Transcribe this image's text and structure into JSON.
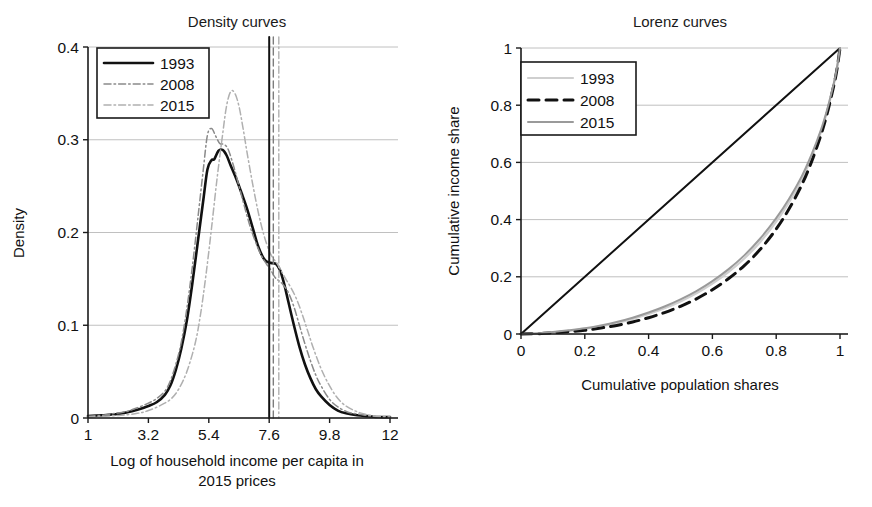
{
  "figure": {
    "background": "#ffffff",
    "panels": [
      "density",
      "lorenz"
    ]
  },
  "chart_data": [
    {
      "type": "line",
      "id": "density",
      "title": "Density curves",
      "xlabel": "Log of household income per capita in 2015 prices",
      "xlabel_line1": "Log of household income per capita in",
      "xlabel_line2": "2015 prices",
      "ylabel": "Density",
      "xlim": [
        1,
        12
      ],
      "ylim": [
        0,
        0.4
      ],
      "xticks": [
        1,
        3.2,
        5.4,
        7.6,
        9.8,
        12
      ],
      "xticklabels": [
        "1",
        "3.2",
        "5.4",
        "7.6",
        "9.8",
        "12"
      ],
      "yticks": [
        0,
        0.1,
        0.2,
        0.3,
        0.4
      ],
      "yticklabels": [
        "0",
        "0.1",
        "0.2",
        "0.3",
        "0.4"
      ],
      "grid": "horizontal",
      "legend_position": "upper-left",
      "legend": [
        "1993",
        "2008",
        "2015"
      ],
      "series": [
        {
          "name": "1993",
          "style": "solid",
          "color": "#111111",
          "width": 2.6,
          "x": [
            1.0,
            1.5,
            2.0,
            2.4,
            2.8,
            3.2,
            3.5,
            3.8,
            4.0,
            4.2,
            4.4,
            4.6,
            4.8,
            5.0,
            5.2,
            5.35,
            5.5,
            5.6,
            5.75,
            5.9,
            6.05,
            6.2,
            6.4,
            6.6,
            6.8,
            7.0,
            7.2,
            7.4,
            7.55,
            7.7,
            7.85,
            8.0,
            8.15,
            8.3,
            8.5,
            8.7,
            8.9,
            9.1,
            9.3,
            9.5,
            9.8,
            10.1,
            10.4,
            10.8,
            11.2,
            11.6,
            12.0
          ],
          "y": [
            0.002,
            0.003,
            0.004,
            0.006,
            0.009,
            0.013,
            0.017,
            0.025,
            0.035,
            0.052,
            0.075,
            0.105,
            0.145,
            0.19,
            0.235,
            0.268,
            0.278,
            0.279,
            0.288,
            0.289,
            0.283,
            0.272,
            0.258,
            0.242,
            0.225,
            0.205,
            0.185,
            0.172,
            0.168,
            0.167,
            0.166,
            0.159,
            0.144,
            0.125,
            0.1,
            0.077,
            0.058,
            0.043,
            0.031,
            0.023,
            0.014,
            0.008,
            0.005,
            0.003,
            0.002,
            0.001,
            0.001
          ]
        },
        {
          "name": "2008",
          "style": "dashdot",
          "color": "#8a8a8a",
          "width": 1.5,
          "x": [
            1.0,
            1.5,
            2.0,
            2.4,
            2.8,
            3.2,
            3.5,
            3.8,
            4.0,
            4.2,
            4.4,
            4.6,
            4.8,
            5.0,
            5.2,
            5.35,
            5.5,
            5.65,
            5.8,
            5.95,
            6.1,
            6.3,
            6.5,
            6.7,
            6.9,
            7.1,
            7.3,
            7.5,
            7.65,
            7.8,
            7.95,
            8.1,
            8.3,
            8.5,
            8.7,
            8.9,
            9.1,
            9.3,
            9.5,
            9.8,
            10.1,
            10.5,
            10.9,
            11.3,
            11.7,
            12.0
          ],
          "y": [
            0.002,
            0.003,
            0.005,
            0.007,
            0.011,
            0.016,
            0.021,
            0.029,
            0.04,
            0.058,
            0.082,
            0.118,
            0.163,
            0.215,
            0.268,
            0.305,
            0.312,
            0.304,
            0.296,
            0.295,
            0.29,
            0.272,
            0.25,
            0.228,
            0.207,
            0.19,
            0.176,
            0.166,
            0.16,
            0.152,
            0.148,
            0.144,
            0.135,
            0.12,
            0.1,
            0.08,
            0.062,
            0.046,
            0.034,
            0.02,
            0.012,
            0.006,
            0.004,
            0.002,
            0.001,
            0.001
          ]
        },
        {
          "name": "2015",
          "style": "dashdot",
          "color": "#b0b0b0",
          "width": 1.5,
          "x": [
            1.0,
            1.6,
            2.2,
            2.8,
            3.2,
            3.6,
            4.0,
            4.3,
            4.6,
            4.9,
            5.1,
            5.3,
            5.5,
            5.7,
            5.9,
            6.05,
            6.2,
            6.35,
            6.5,
            6.65,
            6.8,
            7.0,
            7.2,
            7.4,
            7.6,
            7.75,
            7.9,
            8.05,
            8.2,
            8.4,
            8.6,
            8.8,
            9.0,
            9.2,
            9.45,
            9.7,
            10.0,
            10.3,
            10.7,
            11.1,
            11.5,
            12.0
          ],
          "y": [
            0.001,
            0.002,
            0.003,
            0.005,
            0.008,
            0.013,
            0.02,
            0.031,
            0.05,
            0.08,
            0.112,
            0.155,
            0.205,
            0.258,
            0.305,
            0.337,
            0.352,
            0.35,
            0.336,
            0.312,
            0.285,
            0.252,
            0.222,
            0.198,
            0.18,
            0.172,
            0.166,
            0.158,
            0.15,
            0.14,
            0.128,
            0.112,
            0.094,
            0.076,
            0.056,
            0.04,
            0.025,
            0.015,
            0.008,
            0.004,
            0.002,
            0.001
          ]
        }
      ],
      "vlines": [
        {
          "name": "1993-mean",
          "x": 7.6,
          "style": "solid",
          "color": "#111111",
          "width": 2.0
        },
        {
          "name": "2008-mean",
          "x": 7.75,
          "style": "dashed",
          "color": "#7d7d7d",
          "width": 1.4
        },
        {
          "name": "2015-mean",
          "x": 7.95,
          "style": "dashdot",
          "color": "#b0b0b0",
          "width": 1.4
        }
      ]
    },
    {
      "type": "line",
      "id": "lorenz",
      "title": "Lorenz curves",
      "xlabel": "Cumulative population shares",
      "ylabel": "Cumulative income share",
      "xlim": [
        0,
        1
      ],
      "ylim": [
        0,
        1
      ],
      "xticks": [
        0,
        0.2,
        0.4,
        0.6,
        0.8,
        1
      ],
      "xticklabels": [
        "0",
        "0.2",
        "0.4",
        "0.6",
        "0.8",
        "1"
      ],
      "yticks": [
        0,
        0.2,
        0.4,
        0.6,
        0.8,
        1
      ],
      "yticklabels": [
        "0",
        "0.2",
        "0.4",
        "0.6",
        "0.8",
        "1"
      ],
      "grid": "horizontal",
      "legend_position": "upper-left",
      "legend": [
        "1993",
        "2008",
        "2015"
      ],
      "equality_line": {
        "name": "line-of-equality",
        "style": "solid",
        "color": "#111111",
        "width": 2.0,
        "x": [
          0,
          1
        ],
        "y": [
          0,
          1
        ]
      },
      "series": [
        {
          "name": "1993",
          "style": "solid",
          "color": "#cfcfcf",
          "width": 2.2,
          "x": [
            0,
            0.05,
            0.1,
            0.15,
            0.2,
            0.25,
            0.3,
            0.35,
            0.4,
            0.45,
            0.5,
            0.55,
            0.6,
            0.65,
            0.7,
            0.75,
            0.8,
            0.84,
            0.88,
            0.91,
            0.94,
            0.96,
            0.98,
            0.99,
            1.0
          ],
          "y": [
            0,
            0.002,
            0.006,
            0.011,
            0.018,
            0.027,
            0.039,
            0.053,
            0.07,
            0.09,
            0.114,
            0.142,
            0.176,
            0.216,
            0.264,
            0.322,
            0.393,
            0.46,
            0.54,
            0.615,
            0.705,
            0.78,
            0.87,
            0.925,
            1.0
          ]
        },
        {
          "name": "2008",
          "style": "dashed",
          "color": "#111111",
          "width": 3.0,
          "x": [
            0,
            0.05,
            0.1,
            0.15,
            0.2,
            0.25,
            0.3,
            0.35,
            0.4,
            0.45,
            0.5,
            0.55,
            0.6,
            0.65,
            0.7,
            0.75,
            0.8,
            0.84,
            0.88,
            0.91,
            0.94,
            0.96,
            0.98,
            0.99,
            1.0
          ],
          "y": [
            0,
            0.001,
            0.004,
            0.008,
            0.013,
            0.021,
            0.03,
            0.042,
            0.057,
            0.075,
            0.097,
            0.123,
            0.155,
            0.193,
            0.239,
            0.296,
            0.367,
            0.437,
            0.521,
            0.6,
            0.695,
            0.772,
            0.866,
            0.922,
            1.0
          ]
        },
        {
          "name": "2015",
          "style": "solid",
          "color": "#9a9a9a",
          "width": 2.0,
          "x": [
            0,
            0.05,
            0.1,
            0.15,
            0.2,
            0.25,
            0.3,
            0.35,
            0.4,
            0.45,
            0.5,
            0.55,
            0.6,
            0.65,
            0.7,
            0.75,
            0.8,
            0.84,
            0.88,
            0.91,
            0.94,
            0.96,
            0.98,
            0.99,
            1.0
          ],
          "y": [
            0,
            0.002,
            0.007,
            0.013,
            0.02,
            0.03,
            0.042,
            0.057,
            0.075,
            0.096,
            0.121,
            0.15,
            0.185,
            0.226,
            0.275,
            0.334,
            0.405,
            0.472,
            0.551,
            0.625,
            0.713,
            0.786,
            0.874,
            0.928,
            1.0
          ]
        }
      ]
    }
  ]
}
